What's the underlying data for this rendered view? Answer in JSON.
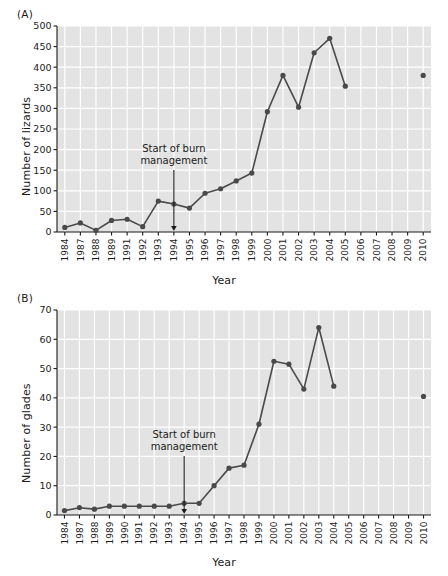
{
  "figure": {
    "panel_a_label": "(A)",
    "panel_b_label": "(B)",
    "xlabel_a": "Year",
    "xlabel_b": "Year"
  },
  "chart_data": [
    {
      "type": "line",
      "panel": "(A)",
      "title": "",
      "xlabel": "Year",
      "ylabel": "Number of lizards",
      "ylim": [
        0,
        500
      ],
      "ytick_step": 50,
      "yticks": [
        0,
        50,
        100,
        150,
        200,
        250,
        300,
        350,
        400,
        450,
        500
      ],
      "grid": true,
      "legend": "none",
      "categories": [
        "1984",
        "1987",
        "1988",
        "1989",
        "1991",
        "1992",
        "1993",
        "1994",
        "1995",
        "1996",
        "1997",
        "1998",
        "1999",
        "2000",
        "2001",
        "2002",
        "2003",
        "2004",
        "2005",
        "2006",
        "2007",
        "2008",
        "2009",
        "2010"
      ],
      "values": [
        11,
        22,
        4,
        28,
        31,
        13,
        75,
        68,
        58,
        94,
        105,
        124,
        143,
        292,
        380,
        303,
        435,
        470,
        354,
        null,
        null,
        null,
        null,
        380
      ],
      "series": [
        {
          "name": "Number of lizards",
          "connected_through": "2005",
          "isolated_points": [
            {
              "x": "2010",
              "y": 380
            }
          ],
          "values": [
            11,
            22,
            4,
            28,
            31,
            13,
            75,
            68,
            58,
            94,
            105,
            124,
            143,
            292,
            380,
            303,
            435,
            470,
            354,
            null,
            null,
            null,
            null,
            380
          ]
        }
      ],
      "annotations": [
        {
          "text_line1": "Start of burn",
          "text_line2": "management",
          "arrow_at_category": "1994",
          "arrow_points_to_y": 0
        }
      ]
    },
    {
      "type": "line",
      "panel": "(B)",
      "title": "",
      "xlabel": "Year",
      "ylabel": "Number of glades",
      "ylim": [
        0,
        70
      ],
      "ytick_step": 10,
      "yticks": [
        0,
        10,
        20,
        30,
        40,
        50,
        60,
        70
      ],
      "grid": true,
      "legend": "none",
      "categories": [
        "1984",
        "1987",
        "1988",
        "1989",
        "1990",
        "1991",
        "1992",
        "1993",
        "1994",
        "1995",
        "1996",
        "1997",
        "1998",
        "1999",
        "2000",
        "2001",
        "2002",
        "2003",
        "2004",
        "2005",
        "2006",
        "2007",
        "2008",
        "2009",
        "2010"
      ],
      "values": [
        1.5,
        2.5,
        2,
        3,
        3,
        3,
        3,
        3,
        4,
        4,
        10,
        16,
        17,
        31,
        52.5,
        51.5,
        43,
        64,
        44,
        null,
        null,
        null,
        null,
        null,
        40.5
      ],
      "series": [
        {
          "name": "Number of glades",
          "connected_through": "2004",
          "isolated_points": [
            {
              "x": "2010",
              "y": 40.5
            }
          ],
          "values": [
            1.5,
            2.5,
            2,
            3,
            3,
            3,
            3,
            3,
            4,
            4,
            10,
            16,
            17,
            31,
            52.5,
            51.5,
            43,
            64,
            44,
            null,
            null,
            null,
            null,
            null,
            40.5
          ]
        }
      ],
      "annotations": [
        {
          "text_line1": "Start of burn",
          "text_line2": "management",
          "arrow_at_category": "1994",
          "arrow_points_to_y": 0
        }
      ]
    }
  ],
  "style": {
    "plot_background": "#e3e3e3",
    "gridline_color": "#ffffff",
    "data_color": "#4a4a4a",
    "axis_color": "#1a1a1a",
    "text_color": "#1a1a1a"
  }
}
